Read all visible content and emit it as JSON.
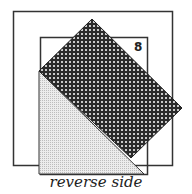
{
  "diagram": {
    "square_label": "8",
    "caption": "reverse side",
    "colors": {
      "stroke": "#333333",
      "dark_pattern": "#2a2a2a",
      "dot": "#ffffff",
      "light_fill": "#e6e6e6"
    }
  }
}
